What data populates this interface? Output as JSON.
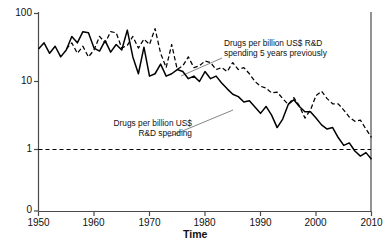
{
  "chart_data": {
    "type": "line",
    "title": "",
    "xlabel": "Time",
    "ylabel": "Number of drugs per billion US$ R&D spending",
    "xlim": [
      1950,
      2010
    ],
    "ylim": [
      1,
      100
    ],
    "yscale": "log",
    "y_broken_below": 1,
    "xticks": [
      1950,
      1960,
      1970,
      1980,
      1990,
      2000,
      2010
    ],
    "xticklabels": [
      "1950",
      "1960",
      "1970",
      "1980",
      "1990",
      "2000",
      "2010"
    ],
    "yticks": [
      0,
      1,
      10,
      100
    ],
    "yticklabels": [
      "0",
      "1",
      "10",
      "100"
    ],
    "grid": false,
    "legend_position": "inline-annotations",
    "reference_lines": [
      {
        "axis": "y",
        "value": 1,
        "style": "dashed"
      }
    ],
    "series": [
      {
        "name": "Drugs per billion US$ R&D spending",
        "style": "solid",
        "color": "#000000",
        "x": [
          1950,
          1951,
          1952,
          1953,
          1954,
          1955,
          1956,
          1957,
          1958,
          1959,
          1960,
          1961,
          1962,
          1963,
          1964,
          1965,
          1966,
          1967,
          1968,
          1969,
          1970,
          1971,
          1972,
          1973,
          1974,
          1975,
          1976,
          1977,
          1978,
          1979,
          1980,
          1981,
          1982,
          1983,
          1984,
          1985,
          1986,
          1987,
          1988,
          1989,
          1990,
          1991,
          1992,
          1993,
          1994,
          1995,
          1996,
          1997,
          1998,
          1999,
          2000,
          2001,
          2002,
          2003,
          2004,
          2005,
          2006,
          2007,
          2008,
          2009,
          2010
        ],
        "values": [
          30,
          37,
          26,
          33,
          23,
          29,
          46,
          37,
          54,
          52,
          31,
          28,
          40,
          27,
          35,
          29,
          57,
          23,
          13,
          32,
          12,
          13,
          18,
          12,
          13,
          15,
          14,
          11,
          12,
          10,
          14,
          11,
          12,
          9.5,
          7.8,
          6.5,
          6.0,
          5.0,
          5.2,
          4.2,
          3.4,
          4.3,
          3.2,
          2.1,
          2.8,
          4.6,
          5.4,
          4.3,
          3.6,
          3.6,
          2.9,
          2.3,
          2.0,
          2.1,
          1.5,
          1.15,
          1.25,
          0.95,
          0.8,
          0.9,
          0.72
        ],
        "annotation": "Drugs per billion US$\nR&D spending"
      },
      {
        "name": "Drugs per billion US$ R&D spending 5 years previously",
        "style": "dashed",
        "color": "#000000",
        "x": [
          1955,
          1956,
          1957,
          1958,
          1959,
          1960,
          1961,
          1962,
          1963,
          1964,
          1965,
          1966,
          1967,
          1968,
          1969,
          1970,
          1971,
          1972,
          1973,
          1974,
          1975,
          1976,
          1977,
          1978,
          1979,
          1980,
          1981,
          1982,
          1983,
          1984,
          1985,
          1986,
          1987,
          1988,
          1989,
          1990,
          1991,
          1992,
          1993,
          1994,
          1995,
          1996,
          1997,
          1998,
          1999,
          2000,
          2001,
          2002,
          2003,
          2004,
          2005,
          2006,
          2007,
          2008,
          2009,
          2010
        ],
        "values": [
          30,
          37,
          26,
          33,
          23,
          29,
          46,
          37,
          54,
          52,
          31,
          34,
          46,
          31,
          42,
          35,
          60,
          26,
          16,
          35,
          15,
          17,
          23,
          16,
          17,
          20,
          19,
          15,
          16,
          14,
          19,
          15,
          16,
          13,
          10,
          8.5,
          8.0,
          6.8,
          7.0,
          5.6,
          4.6,
          5.8,
          4.4,
          2.9,
          3.8,
          6.2,
          7.2,
          5.6,
          4.7,
          4.7,
          3.8,
          3.0,
          2.6,
          2.7,
          2.0,
          1.5
        ],
        "annotation": "Drugs per billion US$ R&D\nspending 5 years previously"
      }
    ]
  },
  "axes": {
    "xlabel": "Time",
    "ylabel": "Number of drugs per billion US$ R&D spending",
    "xticklabels": [
      "1950",
      "1960",
      "1970",
      "1980",
      "1990",
      "2000",
      "2010"
    ],
    "yticklabels": [
      "100",
      "10",
      "1",
      "0"
    ]
  },
  "annotations": {
    "dashed_line_1": "Drugs per billion US$ R&D",
    "dashed_line_2": "spending 5 years previously",
    "solid_line_1": "Drugs per billion US$",
    "solid_line_2": "R&D spending"
  }
}
